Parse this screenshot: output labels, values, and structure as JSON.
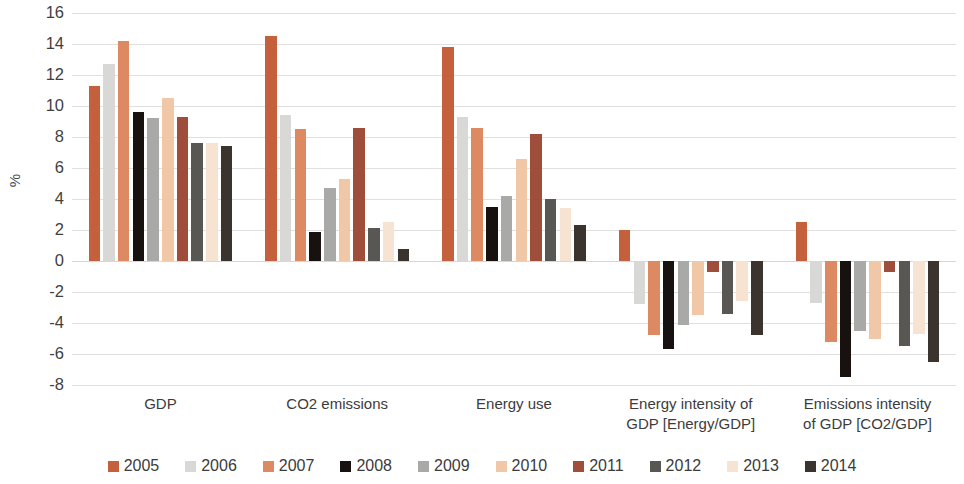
{
  "chart_data": {
    "type": "bar",
    "title": "",
    "subtitle": "",
    "xlabel": "",
    "ylabel": "%",
    "ylim": [
      -8,
      16
    ],
    "ytick_step": 2,
    "yticks": [
      "16",
      "14",
      "12",
      "10",
      "8",
      "6",
      "4",
      "2",
      "0",
      "-2",
      "-4",
      "-6",
      "-8"
    ],
    "grid": true,
    "legend_position": "bottom",
    "categories": [
      "GDP",
      "CO2 emissions",
      "Energy use",
      "Energy intensity of GDP [Energy/GDP]",
      "Emissions intensity of GDP [CO2/GDP]"
    ],
    "category_lines": [
      [
        "GDP"
      ],
      [
        "CO2 emissions"
      ],
      [
        "Energy use"
      ],
      [
        "Energy intensity of",
        "GDP [Energy/GDP]"
      ],
      [
        "Emissions intensity",
        "of GDP [CO2/GDP]"
      ]
    ],
    "series": [
      {
        "name": "2005",
        "color": "#c5603c",
        "values": [
          11.3,
          14.5,
          13.8,
          2.0,
          2.5
        ]
      },
      {
        "name": "2006",
        "color": "#d8d8d6",
        "values": [
          12.7,
          9.4,
          9.3,
          -2.8,
          -2.7
        ]
      },
      {
        "name": "2007",
        "color": "#dd8a63",
        "values": [
          14.2,
          8.5,
          8.6,
          -4.8,
          -5.2
        ]
      },
      {
        "name": "2008",
        "color": "#171210",
        "values": [
          9.6,
          1.9,
          3.5,
          -5.7,
          -7.5
        ]
      },
      {
        "name": "2009",
        "color": "#a9a9a7",
        "values": [
          9.2,
          4.7,
          4.2,
          -4.1,
          -4.5
        ]
      },
      {
        "name": "2010",
        "color": "#f0c7a7",
        "values": [
          10.5,
          5.3,
          6.6,
          -3.5,
          -5.0
        ]
      },
      {
        "name": "2011",
        "color": "#9e4e3a",
        "values": [
          9.3,
          8.6,
          8.2,
          -0.7,
          -0.7
        ]
      },
      {
        "name": "2012",
        "color": "#595753",
        "values": [
          7.6,
          2.1,
          4.0,
          -3.4,
          -5.5
        ]
      },
      {
        "name": "2013",
        "color": "#f6e3d2",
        "values": [
          7.6,
          2.5,
          3.4,
          -2.6,
          -4.7
        ]
      },
      {
        "name": "2014",
        "color": "#3a332e",
        "values": [
          7.4,
          0.8,
          2.3,
          -4.8,
          -6.5
        ]
      }
    ]
  },
  "legend": {
    "items": [
      {
        "label": "2005",
        "color": "#c5603c"
      },
      {
        "label": "2006",
        "color": "#d8d8d6"
      },
      {
        "label": "2007",
        "color": "#dd8a63"
      },
      {
        "label": "2008",
        "color": "#171210"
      },
      {
        "label": "2009",
        "color": "#a9a9a7"
      },
      {
        "label": "2010",
        "color": "#f0c7a7"
      },
      {
        "label": "2011",
        "color": "#9e4e3a"
      },
      {
        "label": "2012",
        "color": "#595753"
      },
      {
        "label": "2013",
        "color": "#f6e3d2"
      },
      {
        "label": "2014",
        "color": "#3a332e"
      }
    ]
  }
}
